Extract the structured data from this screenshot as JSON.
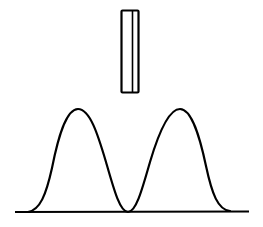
{
  "diagram": {
    "type": "line-drawing",
    "stroke_color": "#000000",
    "background_color": "#ffffff",
    "elements": {
      "slit": {
        "x": 121,
        "y": 10,
        "width": 17,
        "height": 82,
        "inner_line_x": 132
      },
      "baseline": {
        "x1": 15,
        "x2": 249,
        "y": 212
      },
      "curve": {
        "start_x": 28,
        "peaks": [
          {
            "x": 78,
            "y": 109
          },
          {
            "x": 180,
            "y": 109
          }
        ],
        "valley": {
          "x": 128,
          "y": 212
        },
        "end_x": 230
      }
    }
  }
}
